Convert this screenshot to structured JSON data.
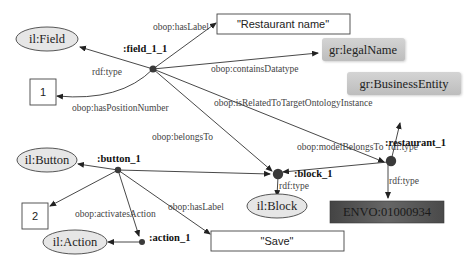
{
  "diagram": {
    "classes": {
      "field": "il:Field",
      "button": "il:Button",
      "action": "il:Action",
      "block": "il:Block"
    },
    "instances": {
      "field": ":field_1_1",
      "button": ":button_1",
      "action": ":action_1",
      "block": ":block_1",
      "restaurant": ":restaurant_1"
    },
    "literals": {
      "field_label": "\"Restaurant name\"",
      "field_position": "1",
      "button_position": "2",
      "button_label": "\"Save\""
    },
    "ontology_terms": {
      "legal_name": "gr:legalName",
      "business_entity": "gr:BusinessEntity",
      "envo": "ENVO:01000934"
    },
    "edges": {
      "field_has_label": "obop:hasLabel",
      "field_type": "rdf:type",
      "field_contains_datatype": "obop:containsDatatype",
      "field_position": "obop:hasPositionNumber",
      "field_related": "obop:isRelatedToTargetOntologyInstance",
      "field_belongs": "obop:belongsTo",
      "restaurant_type_be": "rdf:type",
      "restaurant_model_belongs": "obop:modelBelongsTo",
      "restaurant_type_envo": "rdf:type",
      "block_type": "rdf:type",
      "button_activates": "obop:activatesAction",
      "button_has_label": "obop:hasLabel"
    },
    "colors": {
      "edge": "#333333",
      "class_fill": "#e6e6e6",
      "ontology_fill": "#c8c8c8",
      "envo_fill": "#555555",
      "node_dot": "#3a3a3a"
    }
  }
}
